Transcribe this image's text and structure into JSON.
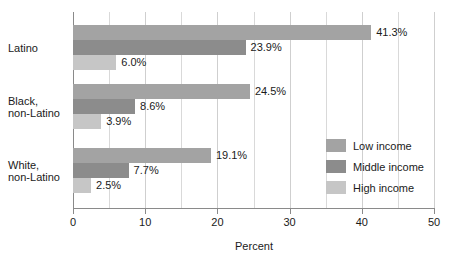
{
  "chart_data": {
    "type": "bar",
    "orientation": "horizontal",
    "title": "",
    "xlabel": "Percent",
    "ylabel": "",
    "xlim": [
      0,
      50
    ],
    "xticks": [
      0,
      10,
      20,
      30,
      40,
      50
    ],
    "xtick_labels": [
      "0",
      "10",
      "20",
      "30",
      "40",
      "50"
    ],
    "minor_gridline_step": 5,
    "grid": true,
    "legend_position": "right-middle",
    "categories": [
      "Latino",
      "Black,\nnon-Latino",
      "White,\nnon-Latino"
    ],
    "category_lines": [
      [
        "Latino"
      ],
      [
        "Black,",
        "non-Latino"
      ],
      [
        "White,",
        "non-Latino"
      ]
    ],
    "series": [
      {
        "name": "Low income",
        "color": "#a3a3a3",
        "values": [
          41.3,
          24.5,
          19.1
        ],
        "labels": [
          "41.3%",
          "24.5%",
          "19.1%"
        ]
      },
      {
        "name": "Middle income",
        "color": "#8c8c8c",
        "values": [
          23.9,
          8.6,
          7.7
        ],
        "labels": [
          "23.9%",
          "8.6%",
          "7.7%"
        ]
      },
      {
        "name": "High income",
        "color": "#c6c6c6",
        "values": [
          6.0,
          3.9,
          2.5
        ],
        "labels": [
          "6.0%",
          "3.9%",
          "2.5%"
        ]
      }
    ]
  },
  "axis": {
    "x_title": "Percent"
  },
  "legend": {
    "items": [
      {
        "label": "Low income",
        "color": "#a3a3a3"
      },
      {
        "label": "Middle income",
        "color": "#8c8c8c"
      },
      {
        "label": "High income",
        "color": "#c6c6c6"
      }
    ]
  }
}
